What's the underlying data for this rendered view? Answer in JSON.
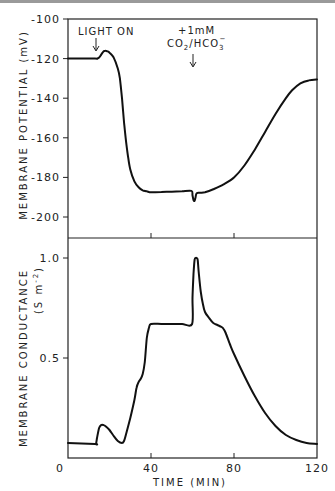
{
  "figure": {
    "annotations": {
      "light_on": "LIGHT ON",
      "co2_line1": "+1mM",
      "co2_line2_main": "CO",
      "co2_line2_sub": "2",
      "co2_line2_mid": "/HCO",
      "co2_line2_sub2": "3",
      "co2_line2_sup": "−"
    },
    "top_axis": {
      "label": "MEMBRANE  POTENTIAL  (mV)",
      "ticks": [
        "-100",
        "-120",
        "-140",
        "-160",
        "-180",
        "-200"
      ]
    },
    "bottom_axis": {
      "label": "MEMBRANE  CONDUCTANCE",
      "unit_label": "(S m",
      "unit_sup": "-2",
      "unit_close": ")",
      "ticks": [
        "1.0",
        "0.5"
      ]
    },
    "x_axis": {
      "label": "TIME  (MIN)",
      "ticks": [
        "0",
        "40",
        "80",
        "120"
      ]
    }
  },
  "chart_data": [
    {
      "type": "line",
      "title": "",
      "xlabel": "TIME (MIN)",
      "ylabel": "MEMBRANE POTENTIAL (mV)",
      "xlim": [
        0,
        120
      ],
      "ylim": [
        -210,
        -100
      ],
      "yticks": [
        -100,
        -120,
        -140,
        -160,
        -180,
        -200
      ],
      "xticks": [
        0,
        40,
        80,
        120
      ],
      "grid": false,
      "annotations": [
        {
          "text": "LIGHT ON",
          "x": 14,
          "arrow": true
        },
        {
          "text": "+1mM CO2/HCO3-",
          "x": 61,
          "arrow": true
        }
      ],
      "x": [
        0,
        13,
        14,
        15,
        16,
        17,
        18,
        19,
        20,
        22,
        24,
        25,
        26,
        27,
        28,
        29,
        30,
        32,
        34,
        36,
        38,
        40,
        45,
        50,
        55,
        59.5,
        60,
        60.5,
        61,
        61.5,
        62,
        64,
        66,
        70,
        75,
        80,
        85,
        90,
        95,
        100,
        105,
        108,
        112,
        116,
        120
      ],
      "values": [
        -120,
        -120,
        -120,
        -119.5,
        -118,
        -116.5,
        -116,
        -116.3,
        -117,
        -119.5,
        -125,
        -130,
        -140,
        -152,
        -162,
        -170,
        -176,
        -182,
        -185,
        -186.5,
        -187,
        -187.5,
        -187.3,
        -187.2,
        -187,
        -186.8,
        -189,
        -191.5,
        -191.8,
        -190,
        -188,
        -187.8,
        -187.5,
        -186,
        -183.5,
        -180,
        -174,
        -166,
        -157,
        -148,
        -140,
        -136,
        -132.5,
        -131,
        -130.5
      ]
    },
    {
      "type": "line",
      "title": "",
      "xlabel": "TIME (MIN)",
      "ylabel": "MEMBRANE CONDUCTANCE (S m^-2)",
      "xlim": [
        0,
        120
      ],
      "ylim": [
        0,
        1.1
      ],
      "yticks": [
        0.5,
        1.0
      ],
      "xticks": [
        0,
        40,
        80,
        120
      ],
      "grid": false,
      "x": [
        0,
        13,
        13.5,
        14,
        15,
        16,
        17,
        18,
        20,
        22,
        24,
        26,
        27,
        28,
        30,
        32,
        33,
        34,
        35,
        36,
        37,
        38,
        39,
        40,
        45,
        50,
        55,
        59.8,
        60,
        60.5,
        61,
        61.5,
        62,
        62.5,
        63,
        64,
        65,
        66,
        68,
        70,
        72,
        74,
        75,
        76,
        78,
        80,
        85,
        90,
        95,
        100,
        105,
        110,
        115,
        120
      ],
      "values": [
        0.075,
        0.07,
        0.07,
        0.1,
        0.15,
        0.165,
        0.165,
        0.16,
        0.14,
        0.11,
        0.085,
        0.075,
        0.085,
        0.12,
        0.2,
        0.29,
        0.35,
        0.38,
        0.395,
        0.42,
        0.48,
        0.6,
        0.65,
        0.67,
        0.67,
        0.67,
        0.67,
        0.67,
        0.8,
        0.92,
        0.99,
        1.0,
        1.0,
        0.99,
        0.93,
        0.83,
        0.77,
        0.73,
        0.7,
        0.675,
        0.665,
        0.655,
        0.645,
        0.625,
        0.57,
        0.52,
        0.41,
        0.31,
        0.225,
        0.16,
        0.115,
        0.09,
        0.075,
        0.07
      ]
    }
  ]
}
